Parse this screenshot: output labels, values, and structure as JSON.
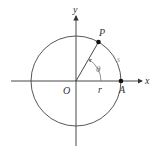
{
  "diagram": {
    "type": "unit-circle-arc-length",
    "labels": {
      "x_axis": "x",
      "y_axis": "y",
      "origin": "O",
      "point_p": "P",
      "point_a": "A",
      "radius": "r",
      "angle": "θ",
      "arc": "s"
    },
    "colors": {
      "line": "#333333",
      "angle_arc": "#777777",
      "arc_label": "#999999",
      "points": "#111111"
    },
    "geometry": {
      "center": [
        76,
        81
      ],
      "radius": 45,
      "angle_degrees": 60
    }
  }
}
